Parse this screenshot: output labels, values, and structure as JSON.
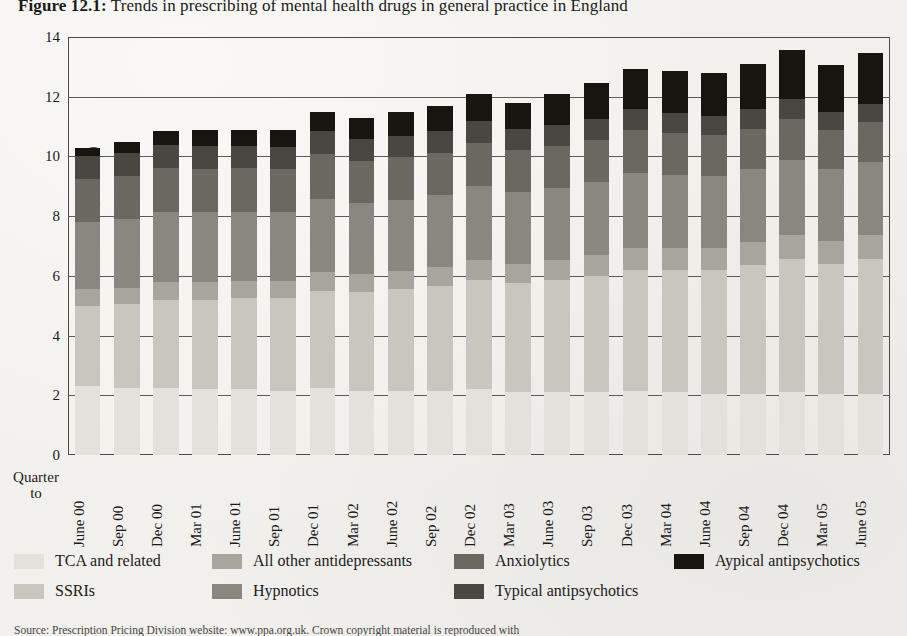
{
  "figure": {
    "label": "Figure 12.1:",
    "title": " Trends in prescribing of mental health drugs in general practice in England",
    "source_note": "Source: Prescription Pricing Division website: www.ppa.org.uk. Crown copyright material is reproduced with"
  },
  "axes": {
    "y_title": "Items (Millions)",
    "y_ticks": [
      "0",
      "2",
      "4",
      "6",
      "8",
      "10",
      "12",
      "14"
    ],
    "x_corner_label": "Quarter\nto",
    "x_corner_line1": "Quarter",
    "x_corner_line2": "to"
  },
  "chart_data": {
    "type": "bar",
    "stacked": true,
    "title": "Figure 12.1: Trends in prescribing of mental health drugs in general practice in England",
    "xlabel": "Quarter to",
    "ylabel": "Items (Millions)",
    "ylim": [
      0,
      14
    ],
    "ytick_step": 2,
    "grid": true,
    "legend_position": "bottom",
    "categories": [
      "June 00",
      "Sep 00",
      "Dec 00",
      "Mar 01",
      "June 01",
      "Sep 01",
      "Dec 01",
      "Mar 02",
      "June 02",
      "Sep 02",
      "Dec 02",
      "Mar 03",
      "June 03",
      "Sep 03",
      "Dec 03",
      "Mar 04",
      "June 04",
      "Sep 04",
      "Dec 04",
      "Mar 05",
      "June 05"
    ],
    "series": [
      {
        "name": "TCA and related",
        "color": "#e3e1dc",
        "values": [
          2.3,
          2.25,
          2.25,
          2.2,
          2.2,
          2.15,
          2.25,
          2.15,
          2.15,
          2.15,
          2.2,
          2.1,
          2.1,
          2.1,
          2.15,
          2.1,
          2.05,
          2.05,
          2.1,
          2.05,
          2.05
        ]
      },
      {
        "name": "SSRIs",
        "color": "#c9c6c0",
        "values": [
          2.7,
          2.8,
          2.95,
          3.0,
          3.05,
          3.1,
          3.25,
          3.3,
          3.4,
          3.5,
          3.65,
          3.65,
          3.75,
          3.9,
          4.05,
          4.1,
          4.15,
          4.3,
          4.45,
          4.35,
          4.5
        ]
      },
      {
        "name": "All other antidepressants",
        "color": "#a8a49e",
        "values": [
          0.55,
          0.55,
          0.58,
          0.58,
          0.58,
          0.58,
          0.62,
          0.6,
          0.62,
          0.65,
          0.68,
          0.66,
          0.68,
          0.7,
          0.74,
          0.74,
          0.74,
          0.78,
          0.82,
          0.78,
          0.82
        ]
      },
      {
        "name": "Hypnotics",
        "color": "#8a8680",
        "values": [
          2.25,
          2.3,
          2.35,
          2.35,
          2.32,
          2.32,
          2.45,
          2.38,
          2.38,
          2.4,
          2.48,
          2.4,
          2.42,
          2.45,
          2.52,
          2.45,
          2.42,
          2.45,
          2.52,
          2.4,
          2.45
        ]
      },
      {
        "name": "Anxiolytics",
        "color": "#6b6761",
        "values": [
          1.45,
          1.45,
          1.48,
          1.45,
          1.45,
          1.42,
          1.5,
          1.42,
          1.42,
          1.42,
          1.45,
          1.4,
          1.4,
          1.4,
          1.42,
          1.38,
          1.35,
          1.35,
          1.38,
          1.3,
          1.32
        ]
      },
      {
        "name": "Typical antipsychotics",
        "color": "#4a4742",
        "values": [
          0.78,
          0.78,
          0.78,
          0.76,
          0.75,
          0.74,
          0.78,
          0.74,
          0.73,
          0.73,
          0.74,
          0.71,
          0.7,
          0.7,
          0.71,
          0.68,
          0.66,
          0.65,
          0.66,
          0.62,
          0.62
        ]
      },
      {
        "name": "Aypical antipsychotics",
        "color": "#17150f",
        "values": [
          0.27,
          0.37,
          0.46,
          0.56,
          0.55,
          0.59,
          0.65,
          0.71,
          0.8,
          0.85,
          0.9,
          0.88,
          1.05,
          1.2,
          1.35,
          1.4,
          1.43,
          1.52,
          1.65,
          1.55,
          1.7
        ]
      }
    ],
    "totals": [
      10.3,
      10.5,
      10.85,
      10.9,
      10.9,
      10.9,
      11.5,
      11.3,
      11.5,
      11.7,
      12.1,
      11.8,
      12.1,
      12.45,
      12.94,
      12.85,
      12.8,
      13.1,
      13.58,
      13.05,
      13.46
    ]
  },
  "legend": {
    "items": [
      {
        "label": "TCA and related",
        "color": "#e3e1dc"
      },
      {
        "label": "SSRIs",
        "color": "#c9c6c0"
      },
      {
        "label": "All other antidepressants",
        "color": "#a8a49e"
      },
      {
        "label": "Hypnotics",
        "color": "#8a8680"
      },
      {
        "label": "Anxiolytics",
        "color": "#6b6761"
      },
      {
        "label": "Typical antipsychotics",
        "color": "#4a4742"
      },
      {
        "label": "Aypical antipsychotics",
        "color": "#17150f"
      }
    ]
  }
}
